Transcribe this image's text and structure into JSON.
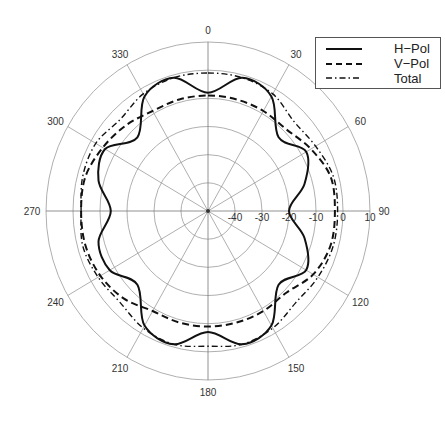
{
  "chart_data": {
    "type": "polar_line",
    "title": "",
    "angular_ticks": [
      "0",
      "30",
      "60",
      "90",
      "120",
      "150",
      "180",
      "210",
      "240",
      "270",
      "300",
      "330"
    ],
    "angular_tick_values": [
      0,
      30,
      60,
      90,
      120,
      150,
      180,
      210,
      240,
      270,
      300,
      330
    ],
    "angular_direction": "clockwise",
    "zero_location": "top",
    "radial_ticks": [
      "-40",
      "-30",
      "-20",
      "-10",
      "0",
      "10"
    ],
    "radial_tick_values": [
      -40,
      -30,
      -20,
      -10,
      0,
      10
    ],
    "rlim": [
      -50,
      10
    ],
    "grid": true,
    "legend_position": "upper right",
    "theta_deg": [
      0,
      15,
      30,
      45,
      60,
      75,
      90,
      105,
      120,
      135,
      150,
      165,
      180,
      195,
      210,
      225,
      240,
      255,
      270,
      285,
      300,
      315,
      330,
      345,
      360
    ],
    "series": [
      {
        "name": "H−Pol",
        "style": "solid",
        "values": [
          -8,
          -1,
          -3,
          -13,
          -8,
          -13,
          -20,
          -13,
          -8,
          -13,
          -3,
          -1,
          -7,
          -1,
          -3,
          -13,
          -8,
          -8,
          -14,
          -8,
          -6,
          -13,
          -3,
          -1,
          -8
        ]
      },
      {
        "name": "V−Pol",
        "style": "dashed",
        "values": [
          -9,
          -9,
          -9,
          -9,
          -6,
          -3,
          -3,
          -3,
          -5,
          -9,
          -9,
          -9,
          -9,
          -9,
          -9,
          -6,
          -4,
          -3,
          -3,
          -3,
          -5,
          -7,
          -9,
          -9,
          -9
        ]
      },
      {
        "name": "Total",
        "style": "dashdot",
        "values": [
          -1,
          -1,
          -2,
          -5,
          -4,
          -2,
          -2,
          -2,
          -3,
          -4,
          -2,
          -1,
          -2,
          -1,
          -2,
          -4,
          -3,
          -2,
          -3,
          -2,
          -2,
          -4,
          -2,
          -1,
          -1
        ]
      }
    ]
  },
  "legend": {
    "items": [
      {
        "label": "H−Pol"
      },
      {
        "label": "V−Pol"
      },
      {
        "label": "Total"
      }
    ]
  }
}
